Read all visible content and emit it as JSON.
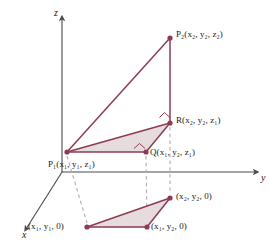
{
  "figure": {
    "background_color": "#ffffff",
    "line_color": "#8c3b52",
    "fill_color": "#e8dfe1",
    "axis_color": "#4a4a4a",
    "dash_color": "#b0a9ab",
    "point_color": "#8c3b52"
  },
  "axes": {
    "x": {
      "label": "x",
      "x": 22,
      "y": 231
    },
    "y": {
      "label": "y",
      "x": 262,
      "y": 178
    },
    "z": {
      "label": "z",
      "x": 54,
      "y": 9
    }
  },
  "points": [
    {
      "id": "P2",
      "name": "point-p2",
      "label": "P₂(x₂, y₂, z₂)",
      "label_main": "P",
      "label_sub": "2",
      "label_coords": "(x₂, y₂, z₂)",
      "px": 170,
      "py": 38,
      "label_x": 176,
      "label_y": 32
    },
    {
      "id": "R",
      "name": "point-r",
      "label": "R(x₂, y₂, z₁)",
      "label_main": "R",
      "label_sub": "",
      "label_coords": "(x₂, y₂, z₁)",
      "px": 170,
      "py": 123,
      "label_x": 176,
      "label_y": 117
    },
    {
      "id": "Q",
      "name": "point-q",
      "label": "Q(x₁, y₂, z₁)",
      "label_main": "Q",
      "label_sub": "",
      "label_coords": "(x₁, y₂, z₁)",
      "px": 146,
      "py": 152,
      "label_x": 150,
      "label_y": 148
    },
    {
      "id": "P1",
      "name": "point-p1",
      "label": "P₁(x₁, y₁, z₁)",
      "label_main": "P",
      "label_sub": "1",
      "label_coords": "(x₁, y₁, z₁)",
      "px": 67,
      "py": 152,
      "label_x": 52,
      "label_y": 159
    },
    {
      "id": "B2",
      "name": "point-x2y2-0",
      "label": "(x₂, y₂, 0)",
      "label_main": "",
      "label_sub": "",
      "label_coords": "(x₂, y₂, 0)",
      "px": 170,
      "py": 198,
      "label_x": 176,
      "label_y": 194
    },
    {
      "id": "B1",
      "name": "point-x1y1-0",
      "label": "(x₁, y₁, 0)",
      "label_main": "",
      "label_sub": "",
      "label_coords": "(x₁, y₁, 0)",
      "px": 87,
      "py": 227,
      "label_x": 32,
      "label_y": 223
    },
    {
      "id": "B3",
      "name": "point-x1y2-0",
      "label": "(x₁, y₂, 0)",
      "label_main": "",
      "label_sub": "",
      "label_coords": "(x₁, y₂, 0)",
      "px": 147,
      "py": 227,
      "label_x": 151,
      "label_y": 223
    }
  ],
  "shapes": {
    "upper_triangle_fill": "67,152 146,152 170,123",
    "big_triangle_edges": "67,152 170,38 170,123 67,152",
    "lower_triangle_fill": "87,227 147,227 170,198"
  },
  "right_angle_marks": [
    {
      "name": "right-angle-mark-r",
      "points": "159,118 164,113 169,118"
    },
    {
      "name": "right-angle-mark-q",
      "points": "134,148 139,143 144,148"
    }
  ],
  "dashed_lines": [
    {
      "name": "dashed-p1-to-base",
      "x1": 67,
      "y1": 156,
      "x2": 87,
      "y2": 223
    },
    {
      "name": "dashed-q-to-base",
      "x1": 146,
      "y1": 156,
      "x2": 147,
      "y2": 223
    },
    {
      "name": "dashed-r-to-base",
      "x1": 170,
      "y1": 127,
      "x2": 170,
      "y2": 194
    }
  ]
}
